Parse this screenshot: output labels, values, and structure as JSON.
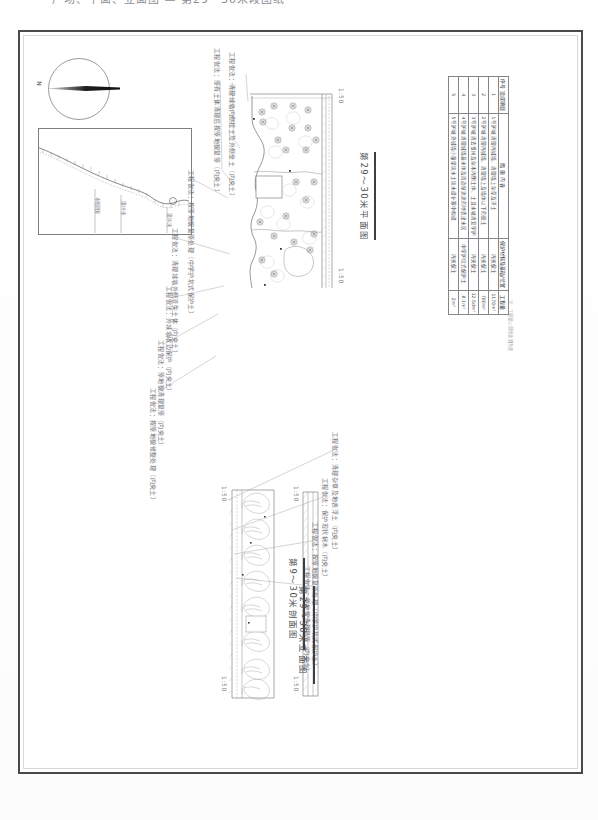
{
  "header": {
    "cut_off_text": "广场、平面、立面图 — 第29～30米段图纸"
  },
  "sheet": {
    "compass": {
      "label": "N",
      "icon": "compass-needle-icon"
    },
    "inset_map": {
      "labels": [
        "本图范围",
        "第29米",
        "第30米",
        "西城墙"
      ]
    }
  },
  "figures": [
    {
      "id": "plan",
      "caption": "第29～30米平面图",
      "scale_marks": [
        "1:50",
        "1:50"
      ]
    },
    {
      "id": "elevation",
      "caption": "第9～30米剖面图",
      "scale_marks": [
        "1:50",
        "1:50"
      ]
    },
    {
      "id": "section",
      "caption": "第29～30米立面图",
      "scale_marks": [
        "1:50",
        "1:50"
      ]
    }
  ],
  "annotations": [
    "工程做法：原有土体清理后按原地貌复原（内夹土）",
    "工程做法：清理城墙内侧挂土及外侧垒土（内夹土）",
    "工程做法：按原地貌复原处理（中学护坑式保护土）",
    "工程做法：清理城墙外侧流失土体（内夹土）",
    "工程做法：外城墙收边保护（内夹土）",
    "工程做法：原地貌清理复原（内夹土）",
    "工程做法：按原地貌修整处理（内夹土）",
    "工程做法：清理杂草及地表浮土（内夹土）",
    "工程做法：保护现状树木（内夹土）"
  ],
  "table": {
    "title": "西城墙29段——30日常保护工程表",
    "columns": [
      "序号 造成项目",
      "措 施 内 容",
      "保护材料及基础/位置",
      "工程量"
    ],
    "rows": [
      {
        "no": "1",
        "name": "1号护坡",
        "desc": "清理内城墙、清理墙上杂草及浮土",
        "material": "内夹保土",
        "qty": "1170m²"
      },
      {
        "no": "2",
        "name": "2号护坡",
        "desc": "清理内城墙、清理墙上及墙体以下的挂土",
        "material": "内夹保土",
        "qty": "780m²"
      },
      {
        "no": "3",
        "name": "3号护坡",
        "desc": "清去根树及杂木内侧土体、土且水坡清复学护",
        "material": "内夹保土",
        "qty": "12.5dm²"
      },
      {
        "no": "4",
        "name": "4号护坡",
        "desc": "清理城墙基水体及周边渐流流的地表出水区",
        "material": "中学护坑式保护土",
        "qty": "8.1m²"
      },
      {
        "no": "5",
        "name": "5号护坡",
        "desc": "外城墙小量堡块水土块水缝补塞中和缝",
        "material": "内夹保土",
        "qty": "2m²"
      }
    ],
    "note": "注：工程量以现场实测为准"
  },
  "colors": {
    "border": "#4a4a4d",
    "line": "#6f6f75",
    "table_border": "#85858c",
    "text": "#4d4d53",
    "needle": "#1d1d21"
  }
}
